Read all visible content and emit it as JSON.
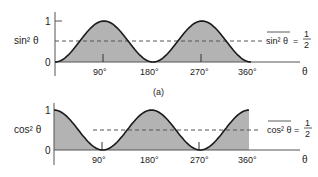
{
  "chart_data": [
    {
      "type": "area",
      "id": "top",
      "ylabel": "sin² θ",
      "xlabel": "θ",
      "x_ticks": [
        "90°",
        "180°",
        "270°",
        "360°"
      ],
      "y_ticks": [
        "0",
        "1"
      ],
      "x_range_deg": [
        0,
        360
      ],
      "ylim": [
        0,
        1
      ],
      "function": "sin^2(theta)",
      "mean_line": 0.5,
      "annotation": {
        "lhs": "sin² θ",
        "eq": "=",
        "num": "1",
        "den": "2"
      },
      "x": [
        0,
        45,
        90,
        135,
        180,
        225,
        270,
        315,
        360
      ],
      "values": [
        0,
        0.5,
        1,
        0.5,
        0,
        0.5,
        1,
        0.5,
        0
      ]
    },
    {
      "type": "area",
      "id": "bottom",
      "ylabel": "cos² θ",
      "xlabel": "θ",
      "x_ticks": [
        "90°",
        "180°",
        "270°",
        "360°"
      ],
      "y_ticks": [
        "0",
        "1"
      ],
      "x_range_deg": [
        0,
        360
      ],
      "ylim": [
        0,
        1
      ],
      "function": "cos^2(theta)",
      "mean_line": 0.5,
      "annotation": {
        "lhs": "cos² θ",
        "eq": "=",
        "num": "1",
        "den": "2"
      },
      "x": [
        0,
        45,
        90,
        135,
        180,
        225,
        270,
        315,
        360
      ],
      "values": [
        1,
        0.5,
        0,
        0.5,
        1,
        0.5,
        0,
        0.5,
        1
      ]
    }
  ],
  "caption": "(a)",
  "colors": {
    "fill": "#b3b3b3",
    "curve": "#1a1a1a",
    "axis": "#555555",
    "dash": "#555555"
  }
}
